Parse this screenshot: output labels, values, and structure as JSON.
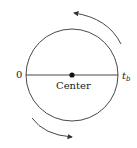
{
  "diagram": {
    "left_label": "0",
    "right_label": "t",
    "right_label_sub": "b",
    "center_label": "Center",
    "stroke_color": "#333333"
  }
}
